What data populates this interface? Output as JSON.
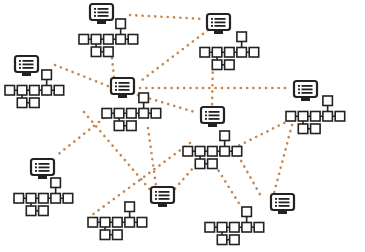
{
  "diagram": {
    "title": "Network of computer nodes with hierarchy trees",
    "colors": {
      "background": "#ffffff",
      "node_stroke": "#222222",
      "link": "#c8864a"
    },
    "nodes": [
      {
        "id": "n1",
        "icon": "monitor-list-icon",
        "monitor": [
          89,
          3
        ],
        "tree": [
          79,
          19
        ]
      },
      {
        "id": "n2",
        "icon": "monitor-list-icon",
        "monitor": [
          206,
          13
        ],
        "tree": [
          200,
          32
        ]
      },
      {
        "id": "n3",
        "icon": "monitor-list-icon",
        "monitor": [
          14,
          55
        ],
        "tree": [
          5,
          70
        ]
      },
      {
        "id": "n4",
        "icon": "monitor-list-icon",
        "monitor": [
          110,
          77
        ],
        "tree": [
          102,
          93
        ]
      },
      {
        "id": "n5",
        "icon": "monitor-list-icon",
        "monitor": [
          293,
          80
        ],
        "tree": [
          286,
          96
        ]
      },
      {
        "id": "n6",
        "icon": "monitor-list-icon",
        "monitor": [
          200,
          106
        ],
        "tree": [
          183,
          131
        ]
      },
      {
        "id": "n7",
        "icon": "monitor-list-icon",
        "monitor": [
          30,
          158
        ],
        "tree": [
          14,
          178
        ]
      },
      {
        "id": "n8",
        "icon": "monitor-list-icon",
        "monitor": [
          150,
          186
        ],
        "tree": [
          88,
          202
        ]
      },
      {
        "id": "n9",
        "icon": "monitor-list-icon",
        "monitor": [
          270,
          193
        ],
        "tree": [
          205,
          207
        ]
      }
    ],
    "links": [
      [
        130,
        15,
        205,
        19
      ],
      [
        208,
        30,
        142,
        80
      ],
      [
        213,
        60,
        212,
        106
      ],
      [
        55,
        65,
        108,
        86
      ],
      [
        140,
        88,
        290,
        88
      ],
      [
        138,
        95,
        198,
        113
      ],
      [
        112,
        58,
        114,
        77
      ],
      [
        104,
        118,
        56,
        156
      ],
      [
        84,
        112,
        152,
        192
      ],
      [
        290,
        120,
        230,
        150
      ],
      [
        292,
        125,
        274,
        193
      ],
      [
        200,
        160,
        172,
        192
      ],
      [
        235,
        150,
        262,
        198
      ],
      [
        190,
        143,
        92,
        215
      ],
      [
        212,
        160,
        240,
        205
      ],
      [
        148,
        128,
        156,
        186
      ]
    ]
  }
}
